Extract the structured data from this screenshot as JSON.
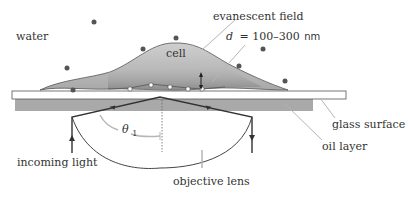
{
  "labels": {
    "water": "water",
    "cell": "cell",
    "evanescent_field": "evanescent field",
    "depth_var": "d",
    "depth_eq": "= 100–300",
    "depth_unit": "nm",
    "glass_surface": "glass surface",
    "oil_layer": "oil layer",
    "incoming_light": "incoming light",
    "objective_lens": "objective lens",
    "angle_symbol": "θ",
    "angle_sub": "1"
  },
  "colors": {
    "cell_fill_light": "#c8c8c8",
    "cell_fill_dark": "#9a9a9a",
    "oil": "#a9a9a9",
    "glass": "#ffffff",
    "ray": "#333333",
    "leader": "#b5b5b5",
    "dot": "#555555"
  }
}
